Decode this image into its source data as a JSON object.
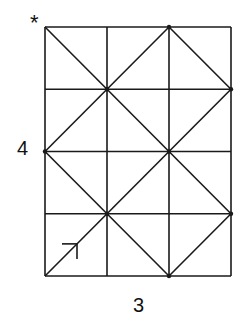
{
  "diagram": {
    "title": "",
    "grid": {
      "cols": 3,
      "rows": 4
    },
    "labels": {
      "height": "4",
      "width": "3",
      "corner_mark": "*"
    },
    "path_points": [
      [
        0,
        0
      ],
      [
        1,
        1
      ],
      [
        2,
        2
      ],
      [
        3,
        3
      ],
      [
        2,
        4
      ],
      [
        1,
        3
      ],
      [
        0,
        2
      ],
      [
        1,
        1
      ],
      [
        2,
        0
      ],
      [
        3,
        1
      ],
      [
        2,
        2
      ],
      [
        1,
        3
      ],
      [
        0,
        4
      ]
    ],
    "bounce_points": [
      [
        1,
        1
      ],
      [
        2,
        2
      ],
      [
        1,
        3
      ],
      [
        0,
        2
      ],
      [
        3,
        1
      ],
      [
        3,
        3
      ],
      [
        2,
        4
      ],
      [
        2,
        0
      ]
    ],
    "start": [
      0,
      0
    ],
    "end": [
      0,
      4
    ],
    "colors": {
      "line": "#1a1a1a",
      "background": "#ffffff"
    }
  }
}
